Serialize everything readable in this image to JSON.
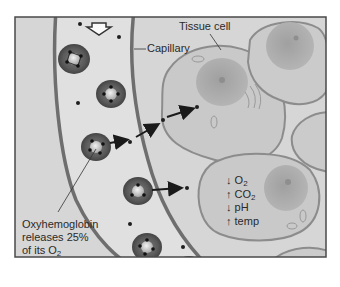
{
  "figure": {
    "colors": {
      "frame_border": "#4a4a4a",
      "background": "#d4d4d4",
      "capillary_wall": "#6e6e6e",
      "capillary_lumen": "#dedede",
      "red_blood_cell": "#5a5a5a",
      "rbc_core": "#bdbdbd",
      "tissue_cell": "#c8c8c8",
      "tissue_cell_outline": "#8c8c8c",
      "nucleus": "#a5a5a5",
      "oxygen_dot": "#1e1e1e",
      "arrow": "#1a1a1a"
    }
  },
  "labels": {
    "capillary": "Capillary",
    "tissue_cell": "Tissue cell",
    "oxyhemoglobin": {
      "line1": "Oxyhemoglobin",
      "line2": "releases 25%",
      "line3_prefix": "of its O",
      "line3_sub": "2"
    },
    "conditions": [
      {
        "arrow": "↓",
        "text": "O",
        "sub": "2"
      },
      {
        "arrow": "↑",
        "text": "CO",
        "sub": "2"
      },
      {
        "arrow": "↓",
        "text": "pH",
        "sub": ""
      },
      {
        "arrow": "↑",
        "text": "temp",
        "sub": ""
      }
    ]
  },
  "icons": {
    "flow_direction": "hollow-down-arrow-icon"
  }
}
